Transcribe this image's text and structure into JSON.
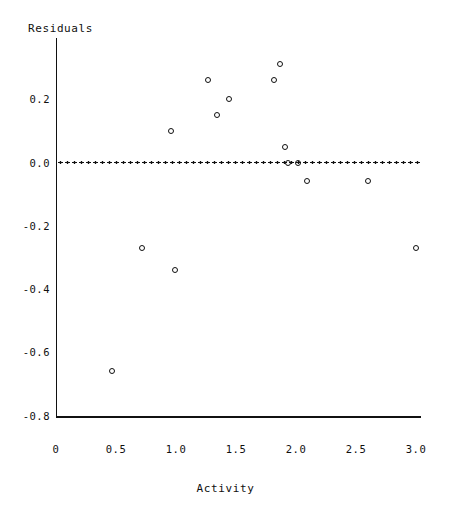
{
  "chart_data": {
    "type": "scatter",
    "title": "",
    "xlabel": "Activity",
    "ylabel": "Residuals",
    "xlim": [
      0,
      3.05
    ],
    "ylim": [
      -0.8,
      0.33
    ],
    "grid": false,
    "legend": null,
    "reference_line": {
      "name": "zero-residual-line",
      "orientation": "horizontal",
      "y": 0.0,
      "style": "dotted"
    },
    "xticks": [
      0,
      0.5,
      1.0,
      1.5,
      2.0,
      2.5,
      3.0
    ],
    "xtick_labels": [
      "0",
      "0.5",
      "1.0",
      "1.5",
      "2.0",
      "2.5",
      "3.0"
    ],
    "yticks": [
      0.2,
      0.0,
      -0.2,
      -0.4,
      -0.6,
      -0.8
    ],
    "ytick_labels": [
      "0.2",
      "0.0",
      "-0.2",
      "-0.4",
      "-0.6",
      "-0.8"
    ],
    "series": [
      {
        "name": "residuals",
        "marker": "open-circle",
        "color": "#101010",
        "x": [
          0.47,
          0.72,
          0.96,
          0.99,
          1.27,
          1.34,
          1.44,
          1.82,
          1.87,
          1.91,
          1.93,
          2.02,
          2.09,
          2.6,
          3.0
        ],
        "y": [
          -0.66,
          -0.27,
          0.1,
          -0.34,
          0.26,
          0.15,
          0.2,
          0.26,
          0.31,
          0.05,
          0.0,
          0.0,
          -0.06,
          -0.06,
          -0.27
        ]
      }
    ]
  },
  "axis": {
    "y_title": "Residuals",
    "x_title": "Activity"
  }
}
